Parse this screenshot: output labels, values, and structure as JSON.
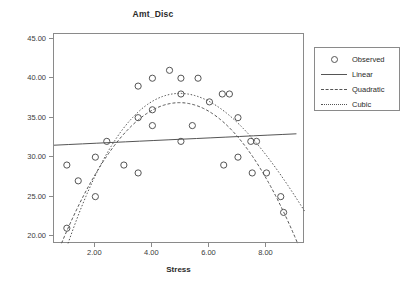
{
  "chart_data": {
    "type": "scatter",
    "title": "Amt_Disc",
    "xlabel": "Stress",
    "ylabel": "",
    "xlim": [
      0.55,
      9.35
    ],
    "ylim": [
      19.0,
      45.6
    ],
    "grid": false,
    "legend_position": "right-outside",
    "xticks": [
      "2.00",
      "4.00",
      "6.00",
      "8.00"
    ],
    "xtick_values": [
      2,
      4,
      6,
      8
    ],
    "yticks": [
      "20.00",
      "25.00",
      "30.00",
      "35.00",
      "40.00",
      "45.00"
    ],
    "ytick_values": [
      20,
      25,
      30,
      35,
      40,
      45
    ],
    "legend": [
      {
        "label": "Observed",
        "glyph": "circle-marker"
      },
      {
        "label": "Linear",
        "glyph": "solid-line"
      },
      {
        "label": "Quadratic",
        "glyph": "dashed-line"
      },
      {
        "label": "Cubic",
        "glyph": "dotted-line"
      }
    ],
    "series": [
      {
        "name": "Observed",
        "type": "scatter",
        "marker": "open-circle",
        "color": "#555555",
        "points": [
          [
            1.0,
            29
          ],
          [
            1.0,
            21
          ],
          [
            1.4,
            27
          ],
          [
            2.0,
            30
          ],
          [
            2.0,
            25
          ],
          [
            2.4,
            32
          ],
          [
            3.0,
            29
          ],
          [
            3.5,
            39
          ],
          [
            3.5,
            35
          ],
          [
            3.5,
            28
          ],
          [
            4.0,
            40
          ],
          [
            4.0,
            36
          ],
          [
            4.0,
            34
          ],
          [
            4.6,
            41
          ],
          [
            5.0,
            40
          ],
          [
            5.0,
            38
          ],
          [
            5.0,
            32
          ],
          [
            5.4,
            34
          ],
          [
            5.6,
            40
          ],
          [
            6.0,
            37
          ],
          [
            6.45,
            38
          ],
          [
            6.7,
            38
          ],
          [
            6.5,
            29
          ],
          [
            7.0,
            35
          ],
          [
            7.0,
            30
          ],
          [
            7.45,
            32
          ],
          [
            7.65,
            32
          ],
          [
            7.5,
            28
          ],
          [
            8.0,
            28
          ],
          [
            8.5,
            25
          ],
          [
            8.6,
            23
          ]
        ]
      },
      {
        "name": "Linear",
        "type": "line",
        "style": "solid",
        "color": "#555555",
        "equation": "y = 31.42 + 0.17x",
        "fit": {
          "intercept": 31.42,
          "slope": 0.17
        }
      },
      {
        "name": "Quadratic",
        "type": "line",
        "style": "dashed",
        "color": "#555555",
        "equation": "y = 11.4 + 10.3x - 1.04x^2",
        "fit": {
          "c0": 11.4,
          "c1": 10.3,
          "c2": -1.04
        }
      },
      {
        "name": "Cubic",
        "type": "line",
        "style": "dotted",
        "color": "#555555",
        "equation": "y = 6.2 + 14.2x - 1.84x^2 + 0.055x^3",
        "fit": {
          "c0": 6.2,
          "c1": 14.2,
          "c2": -1.84,
          "c3": 0.055
        }
      }
    ]
  }
}
